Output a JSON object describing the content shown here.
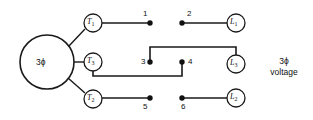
{
  "diagram": {
    "background_color": "#ffffff",
    "line_color": "#1a1a1a",
    "dot_color": "#111111",
    "source": {
      "label": "3ϕ",
      "name": "three-phase-source"
    },
    "caption": {
      "line1": "3ϕ",
      "line2": "voltage"
    },
    "transformer_nodes": [
      {
        "id": "T1",
        "base": "T",
        "sub": "1"
      },
      {
        "id": "T3",
        "base": "T",
        "sub": "3"
      },
      {
        "id": "T2",
        "base": "T",
        "sub": "2"
      }
    ],
    "load_nodes": [
      {
        "id": "L1",
        "base": "L",
        "sub": "1"
      },
      {
        "id": "L3",
        "base": "L",
        "sub": "3"
      },
      {
        "id": "L2",
        "base": "L",
        "sub": "2"
      }
    ],
    "terminals": [
      {
        "label": "1"
      },
      {
        "label": "2"
      },
      {
        "label": "3"
      },
      {
        "label": "4"
      },
      {
        "label": "5"
      },
      {
        "label": "6"
      }
    ]
  }
}
